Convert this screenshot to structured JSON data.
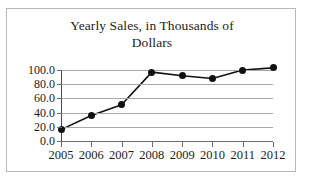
{
  "figure": {
    "border_color": "#b8b8b8",
    "background": "#ffffff"
  },
  "chart_data": {
    "type": "line",
    "title": "Yearly Sales, in Thousands of Dollars",
    "title_line_1": "Yearly Sales, in Thousands of",
    "title_line_2": "Dollars",
    "xlabel": "",
    "ylabel": "",
    "categories": [
      "2005",
      "2006",
      "2007",
      "2008",
      "2009",
      "2010",
      "2011",
      "2012"
    ],
    "values": [
      16.0,
      36.0,
      51.0,
      97.0,
      92.0,
      88.0,
      100.0,
      103.0
    ],
    "series": [
      {
        "name": "Yearly Sales",
        "values": [
          16.0,
          36.0,
          51.0,
          97.0,
          92.0,
          88.0,
          100.0,
          103.0
        ],
        "line_color": "#111111",
        "marker_color": "#111111",
        "marker": "circle"
      }
    ],
    "ylim": [
      0,
      100
    ],
    "xlim": [
      "2005",
      "2012"
    ],
    "ytick_labels": [
      "100.0",
      "80.0",
      "60.0",
      "40.0",
      "20.0",
      "0.0"
    ],
    "ytick_values": [
      100,
      80,
      60,
      40,
      20,
      0
    ],
    "xtick_labels": [
      "2005",
      "2006",
      "2007",
      "2008",
      "2009",
      "2010",
      "2011",
      "2012"
    ],
    "grid": true,
    "grid_color": "#a9a9a9",
    "grid_axis": "y",
    "legend": false,
    "legend_position": "none"
  }
}
